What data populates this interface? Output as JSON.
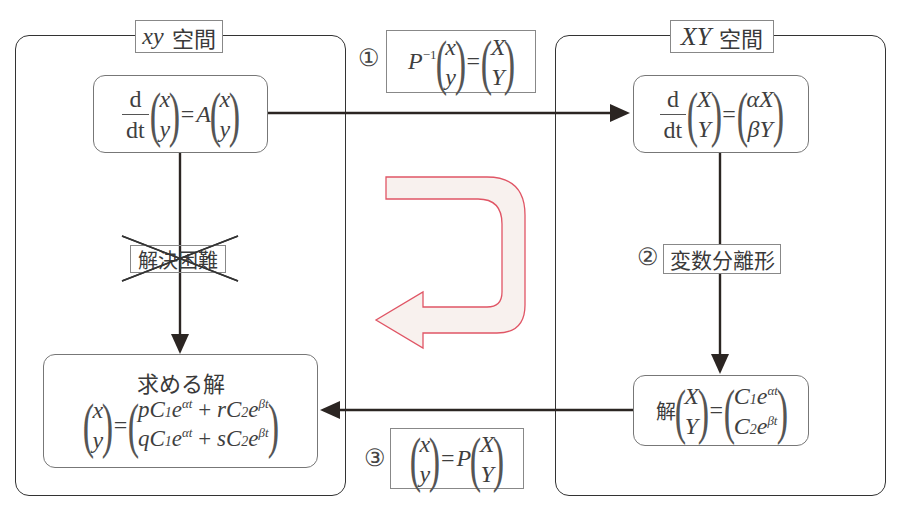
{
  "left_space": {
    "title": "xy 空間",
    "title_var": "xy",
    "title_word": "空間",
    "system_eq": {
      "d": "d",
      "dt": "dt",
      "lhs_vec": [
        "x",
        "y"
      ],
      "equals": "=",
      "matrix": "A",
      "rhs_vec": [
        "x",
        "y"
      ]
    },
    "blocked_label": "解決困難",
    "result_box": {
      "title": "求める解",
      "lhs_vec": [
        "x",
        "y"
      ],
      "equals": "=",
      "rhs_rows": [
        "pC₁e^{αt} + rC₂e^{βt}",
        "qC₁e^{αt} + sC₂e^{βt}"
      ],
      "row1": {
        "a": "p",
        "b": "r"
      },
      "row2": {
        "a": "q",
        "b": "s"
      },
      "c1": "C",
      "c1_sub": "1",
      "c2": "C",
      "c2_sub": "2",
      "e": "e",
      "exp1": "αt",
      "exp2": "βt",
      "plus": "+"
    }
  },
  "right_space": {
    "title": "XY 空間",
    "title_var": "XY",
    "title_word": "空間",
    "system_eq": {
      "d": "d",
      "dt": "dt",
      "lhs_vec": [
        "X",
        "Y"
      ],
      "equals": "=",
      "rhs_vec": [
        "αX",
        "βY"
      ]
    },
    "step_label": "変数分離形",
    "solution_box": {
      "prefix": "解",
      "lhs_vec": [
        "X",
        "Y"
      ],
      "equals": "=",
      "rhs_rows": [
        "C₁e^{αt}",
        "C₂e^{βt}"
      ],
      "c": "C",
      "sub1": "1",
      "sub2": "2",
      "e": "e",
      "exp1": "αt",
      "exp2": "βt"
    }
  },
  "steps": [
    {
      "number": "①",
      "matrix": "P",
      "sup": "−1",
      "lhs_vec": [
        "x",
        "y"
      ],
      "equals": "=",
      "rhs_vec": [
        "X",
        "Y"
      ]
    },
    {
      "number": "②",
      "label": "変数分離形"
    },
    {
      "number": "③",
      "lhs_vec": [
        "x",
        "y"
      ],
      "equals": "=",
      "matrix": "P",
      "rhs_vec": [
        "X",
        "Y"
      ]
    }
  ],
  "colors": {
    "line": "#2b2522",
    "box_border": "#777777",
    "uturn_fill": "#f8f1ee",
    "uturn_stroke": "#e05565"
  }
}
